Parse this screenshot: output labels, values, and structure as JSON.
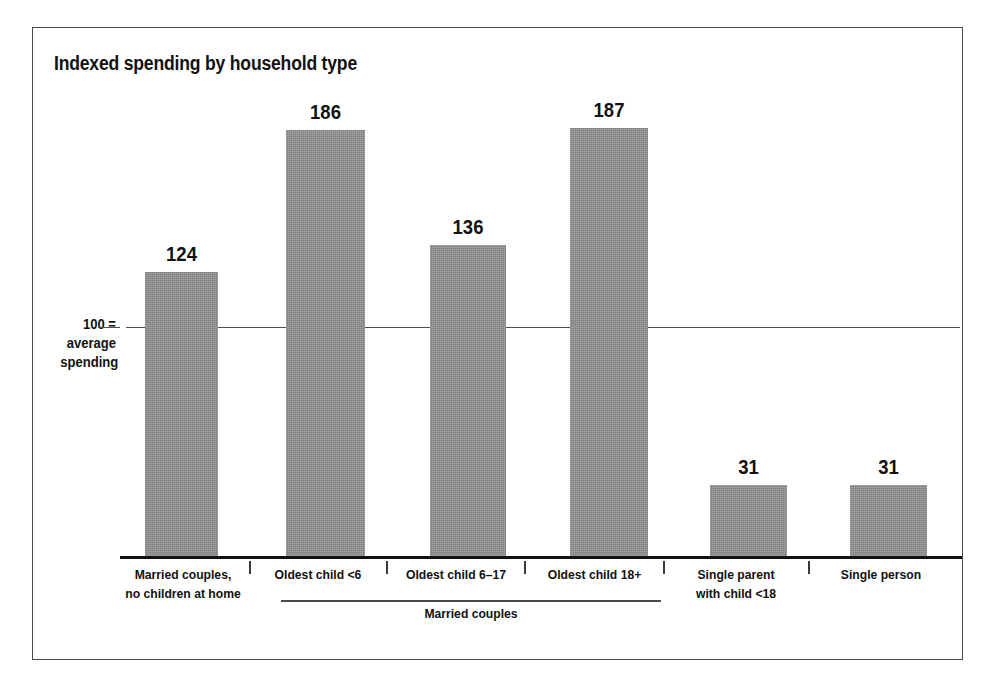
{
  "figure": {
    "title": "Indexed spending by household type",
    "axis_caption_lines": [
      "100 =",
      "average",
      "spending"
    ],
    "group_bracket_label": "Married couples",
    "frame_color": "#4a4a4a",
    "bar_color": "#8e8e8e",
    "text_color": "#111111"
  },
  "chart_data": {
    "type": "bar",
    "title": "Indexed spending by household type",
    "xlabel": "",
    "ylabel": "100 = average spending",
    "categories": [
      "Married couples, no children at home",
      "Oldest child <6",
      "Oldest child 6–17",
      "Oldest child 18+",
      "Single parent with child <18",
      "Single person"
    ],
    "category_label_lines": [
      [
        "Married couples,",
        "no children at home"
      ],
      [
        "Oldest child <6"
      ],
      [
        "Oldest child 6–17"
      ],
      [
        "Oldest child 18+"
      ],
      [
        "Single parent",
        "with child <18"
      ],
      [
        "Single person"
      ]
    ],
    "values": [
      124,
      186,
      136,
      187,
      31,
      31
    ],
    "value_labels": [
      "124",
      "186",
      "136",
      "187",
      "31",
      "31"
    ],
    "reference_line": 100,
    "reference_line_label": "100 = average spending",
    "ylim": [
      0,
      200
    ],
    "grid": false,
    "legend": null,
    "group_brackets": [
      {
        "label": "Married couples",
        "categories": [
          "Oldest child <6",
          "Oldest child 6–17",
          "Oldest child 18+"
        ]
      }
    ]
  }
}
